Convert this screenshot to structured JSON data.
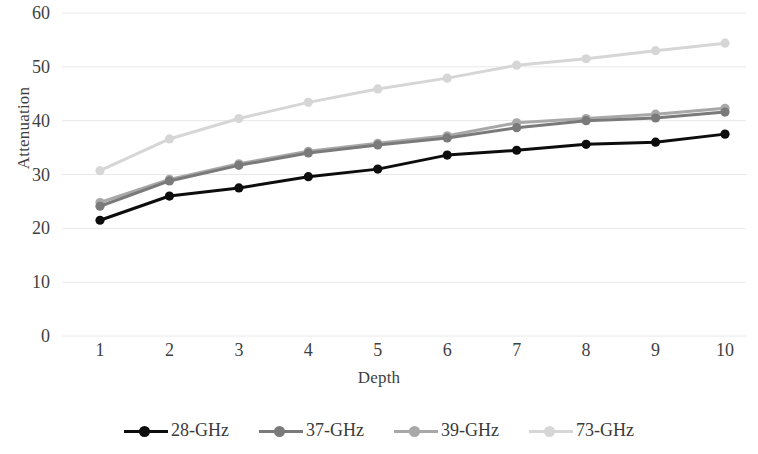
{
  "chart_data": {
    "type": "line",
    "title": "",
    "xlabel": "Depth",
    "ylabel": "Attenuation",
    "x": [
      1,
      2,
      3,
      4,
      5,
      6,
      7,
      8,
      9,
      10
    ],
    "categories": [
      "1",
      "2",
      "3",
      "4",
      "5",
      "6",
      "7",
      "8",
      "9",
      "10"
    ],
    "xlim": [
      1,
      10
    ],
    "ylim": [
      0,
      60
    ],
    "yticks": [
      0,
      10,
      20,
      30,
      40,
      50,
      60
    ],
    "ytick_labels": [
      "0",
      "10",
      "20",
      "30",
      "40",
      "50",
      "60"
    ],
    "xticks": [
      1,
      2,
      3,
      4,
      5,
      6,
      7,
      8,
      9,
      10
    ],
    "xtick_labels": [
      "1",
      "2",
      "3",
      "4",
      "5",
      "6",
      "7",
      "8",
      "9",
      "10"
    ],
    "grid": "horizontal",
    "grid_color": "#e8e8e8",
    "legend_position": "bottom",
    "marker": "circle",
    "series": [
      {
        "name": "28-GHz",
        "color": "#0d0d0d",
        "values": [
          21.5,
          26.0,
          27.5,
          29.6,
          31.0,
          33.6,
          34.5,
          35.6,
          36.0,
          37.5
        ]
      },
      {
        "name": "37-GHz",
        "color": "#7a7a7a",
        "values": [
          24.1,
          28.8,
          31.7,
          34.0,
          35.5,
          36.8,
          38.7,
          40.0,
          40.5,
          41.6
        ]
      },
      {
        "name": "39-GHz",
        "color": "#a8a8a8",
        "values": [
          24.8,
          29.1,
          32.0,
          34.3,
          35.8,
          37.2,
          39.6,
          40.4,
          41.2,
          42.3
        ]
      },
      {
        "name": "73-GHz",
        "color": "#d6d6d6",
        "values": [
          30.7,
          36.6,
          40.4,
          43.4,
          45.9,
          47.9,
          50.3,
          51.5,
          53.0,
          54.4
        ]
      }
    ]
  },
  "legend": {
    "items": [
      {
        "label": "28-GHz"
      },
      {
        "label": "37-GHz"
      },
      {
        "label": "39-GHz"
      },
      {
        "label": "73-GHz"
      }
    ]
  }
}
